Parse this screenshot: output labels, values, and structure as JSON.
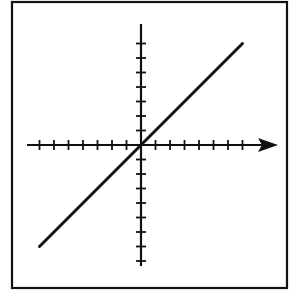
{
  "chart_data": {
    "type": "line",
    "title": "",
    "xlabel": "",
    "ylabel": "",
    "series": [
      {
        "name": "line",
        "x": [
          -7,
          7
        ],
        "y": [
          -7,
          7
        ]
      }
    ],
    "xlim": [
      -8,
      9
    ],
    "ylim": [
      -8,
      8
    ],
    "x_ticks": [
      -7,
      -6,
      -5,
      -4,
      -3,
      -2,
      -1,
      1,
      2,
      3,
      4,
      5,
      6,
      7
    ],
    "y_ticks": [
      -8,
      -7,
      -6,
      -5,
      -4,
      -3,
      -2,
      -1,
      1,
      2,
      3,
      4,
      5,
      6,
      7
    ],
    "grid": false,
    "legend": null,
    "x_axis_arrow": true,
    "colors": {
      "line": "#111111",
      "axes": "#111111",
      "border": "#111111",
      "background": "#ffffff"
    }
  }
}
